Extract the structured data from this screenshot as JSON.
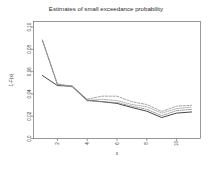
{
  "chart_data": {
    "type": "line",
    "title": "Estimates of small exceedance probability",
    "xlabel": "x",
    "ylabel": "1-F(x)",
    "xlim": [
      0.4,
      11.6
    ],
    "ylim": [
      0.0,
      0.105
    ],
    "grid": false,
    "legend": "none",
    "xticks": [
      2,
      4,
      6,
      8,
      10
    ],
    "xticklabels": [
      "2",
      "4",
      "6",
      "8",
      "10"
    ],
    "yticks": [
      0.0,
      0.02,
      0.04,
      0.06,
      0.08,
      0.1
    ],
    "yticklabels": [
      "0.0",
      "0.02",
      "0.04",
      "0.06",
      "0.08",
      "0.10"
    ],
    "x": [
      1,
      2,
      3,
      4,
      5,
      6,
      7,
      8,
      9,
      10,
      11
    ],
    "series": [
      {
        "name": "empirical",
        "style": "solid",
        "color": "#3c3c3c",
        "values": [
          0.0565,
          0.0475,
          0.047,
          0.0345,
          0.033,
          0.0315,
          0.0278,
          0.0245,
          0.0188,
          0.0228,
          0.0238
        ]
      },
      {
        "name": "estimate-1",
        "style": "dashed",
        "color": "#8d8d8d",
        "values": [
          0.0885,
          0.049,
          0.0468,
          0.0352,
          0.038,
          0.038,
          0.033,
          0.0305,
          0.0243,
          0.029,
          0.0298
        ]
      },
      {
        "name": "estimate-2",
        "style": "dotted",
        "color": "#9a9a9a",
        "values": [
          0.088,
          0.0487,
          0.0465,
          0.034,
          0.0352,
          0.034,
          0.0305,
          0.0285,
          0.0228,
          0.0268,
          0.0282
        ]
      },
      {
        "name": "estimate-3",
        "style": "dotdash",
        "color": "#868686",
        "values": [
          0.0878,
          0.0484,
          0.0463,
          0.0338,
          0.033,
          0.0322,
          0.029,
          0.0262,
          0.0205,
          0.025,
          0.0262
        ]
      }
    ]
  }
}
